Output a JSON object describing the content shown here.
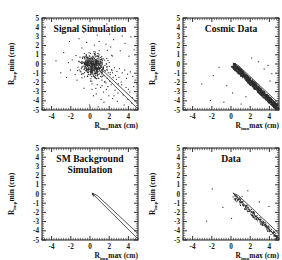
{
  "figure": {
    "panel_count": 4,
    "axis": {
      "xlabel_main": "R",
      "xlabel_sub": "imp",
      "xlabel_rest": "max (cm)",
      "ylabel_main": "R",
      "ylabel_sub": "imp",
      "ylabel_rest": "min (cm)",
      "xticks": [
        "-4",
        "-2",
        "0",
        "2",
        "4"
      ],
      "xtick_values": [
        -4,
        -2,
        0,
        2,
        4
      ],
      "yticks": [
        "5",
        "4",
        "3",
        "2",
        "1",
        "0",
        "-1",
        "-2",
        "-3",
        "-4",
        "-5"
      ],
      "ytick_values": [
        5,
        4,
        3,
        2,
        1,
        0,
        -1,
        -2,
        -3,
        -4,
        -5
      ],
      "xlim": [
        -5,
        5
      ],
      "ylim": [
        -5,
        5
      ]
    }
  },
  "colors": {
    "ink": "#1a1a1a",
    "point": "#2e2e2e",
    "line": "#2b2b2b",
    "background": "#ffffff"
  },
  "chart_data": [
    {
      "type": "scatter",
      "title": "Signal Simulation",
      "title_lines": [
        "Signal Simulation"
      ],
      "xlabel": "R_imp max (cm)",
      "ylabel": "R_imp min (cm)",
      "xlim": [
        -5,
        5
      ],
      "ylim": [
        -5,
        5
      ],
      "grid": false,
      "legend": "none",
      "annotations": [
        {
          "type": "band",
          "note": "cosmic rejection band",
          "line1": [
            [
              0.2,
              0.1
            ],
            [
              5.0,
              -4.9
            ]
          ],
          "line2": [
            [
              0.75,
              -0.15
            ],
            [
              5.0,
              -4.3
            ]
          ]
        }
      ],
      "points": [
        [
          0.05,
          0.15
        ],
        [
          0.2,
          -0.05
        ],
        [
          -0.1,
          0.3
        ],
        [
          0.35,
          0.05
        ],
        [
          0.5,
          -0.3
        ],
        [
          -0.3,
          -0.2
        ],
        [
          0.15,
          -0.55
        ],
        [
          0.6,
          0.25
        ],
        [
          0.8,
          -0.1
        ],
        [
          -0.45,
          0.1
        ],
        [
          0.25,
          0.45
        ],
        [
          0.95,
          -0.45
        ],
        [
          1.2,
          -0.2
        ],
        [
          0.45,
          -0.85
        ],
        [
          -0.15,
          -0.75
        ],
        [
          1.05,
          0.15
        ],
        [
          0.7,
          -0.65
        ],
        [
          1.35,
          -0.55
        ],
        [
          0.1,
          0.75
        ],
        [
          -0.55,
          -0.45
        ],
        [
          1.55,
          -0.15
        ],
        [
          0.85,
          0.55
        ],
        [
          0.3,
          -1.15
        ],
        [
          1.75,
          -0.35
        ],
        [
          -0.75,
          0.05
        ],
        [
          1.15,
          -0.95
        ],
        [
          0.55,
          1.05
        ],
        [
          2.0,
          -0.25
        ],
        [
          -0.25,
          -1.35
        ],
        [
          1.45,
          -1.25
        ],
        [
          0.9,
          -1.55
        ],
        [
          2.25,
          -0.6
        ],
        [
          0.05,
          -1.85
        ],
        [
          1.9,
          -0.95
        ],
        [
          -0.95,
          -0.85
        ],
        [
          2.55,
          -0.4
        ],
        [
          1.25,
          -1.75
        ],
        [
          0.4,
          1.35
        ],
        [
          2.8,
          -0.8
        ],
        [
          -1.25,
          -0.35
        ],
        [
          1.65,
          -2.05
        ],
        [
          3.05,
          -0.5
        ],
        [
          0.75,
          -2.25
        ],
        [
          2.4,
          -1.45
        ],
        [
          -0.6,
          1.15
        ],
        [
          3.35,
          -0.95
        ],
        [
          2.05,
          -1.85
        ],
        [
          1.1,
          -2.55
        ],
        [
          3.6,
          -0.65
        ],
        [
          -1.55,
          -1.15
        ],
        [
          2.75,
          -1.65
        ],
        [
          0.2,
          -2.75
        ],
        [
          3.9,
          -1.1
        ],
        [
          1.85,
          -2.45
        ],
        [
          4.2,
          -0.85
        ],
        [
          2.95,
          -2.15
        ],
        [
          -0.85,
          1.75
        ],
        [
          1.4,
          -3.05
        ],
        [
          4.45,
          -1.35
        ],
        [
          3.25,
          -1.95
        ],
        [
          0.65,
          -3.25
        ],
        [
          2.6,
          -2.85
        ],
        [
          4.7,
          -1.75
        ],
        [
          -2.05,
          -0.65
        ],
        [
          3.75,
          -2.55
        ],
        [
          1.95,
          -3.45
        ],
        [
          4.15,
          -3.05
        ],
        [
          0.45,
          2.05
        ],
        [
          2.35,
          -3.75
        ],
        [
          4.55,
          -2.45
        ],
        [
          3.45,
          -3.35
        ],
        [
          1.15,
          -3.85
        ],
        [
          -1.85,
          0.45
        ],
        [
          4.85,
          -2.05
        ],
        [
          2.85,
          -4.05
        ],
        [
          0.95,
          2.45
        ],
        [
          3.95,
          -3.85
        ],
        [
          -0.35,
          2.35
        ],
        [
          4.35,
          -4.25
        ],
        [
          1.65,
          2.15
        ],
        [
          -2.45,
          -1.45
        ],
        [
          2.15,
          1.85
        ],
        [
          4.9,
          -3.45
        ],
        [
          -1.15,
          2.75
        ],
        [
          3.15,
          1.45
        ],
        [
          0.75,
          3.15
        ],
        [
          -3.05,
          -0.95
        ],
        [
          2.45,
          2.65
        ],
        [
          4.05,
          0.85
        ],
        [
          -0.65,
          3.45
        ],
        [
          1.35,
          3.75
        ],
        [
          3.65,
          2.25
        ],
        [
          -2.75,
          1.25
        ],
        [
          0.25,
          4.05
        ],
        [
          4.6,
          1.55
        ],
        [
          2.05,
          3.25
        ],
        [
          -1.45,
          3.85
        ],
        [
          3.35,
          3.05
        ],
        [
          -3.55,
          0.35
        ],
        [
          1.75,
          4.35
        ],
        [
          4.25,
          2.95
        ],
        [
          -0.05,
          -4.45
        ],
        [
          2.65,
          4.15
        ],
        [
          -2.15,
          2.45
        ],
        [
          0.15,
          -0.25
        ],
        [
          0.4,
          0.35
        ],
        [
          -0.2,
          -0.45
        ],
        [
          0.65,
          -0.75
        ],
        [
          1.0,
          0.45
        ],
        [
          0.3,
          0.85
        ],
        [
          -0.4,
          0.55
        ],
        [
          0.85,
          -1.15
        ],
        [
          1.3,
          0.35
        ],
        [
          0.55,
          -1.45
        ],
        [
          1.6,
          -0.75
        ],
        [
          0.05,
          1.15
        ],
        [
          -0.7,
          -1.05
        ],
        [
          1.1,
          -1.35
        ],
        [
          2.1,
          -1.15
        ],
        [
          0.95,
          1.45
        ],
        [
          1.5,
          -1.95
        ],
        [
          2.35,
          -0.95
        ],
        [
          0.2,
          -2.15
        ],
        [
          1.8,
          -1.55
        ],
        [
          -1.05,
          0.75
        ],
        [
          2.65,
          -1.25
        ],
        [
          1.25,
          -2.35
        ],
        [
          3.0,
          -1.45
        ],
        [
          0.6,
          -2.65
        ],
        [
          2.2,
          -2.25
        ],
        [
          3.3,
          -2.25
        ],
        [
          1.7,
          -2.75
        ],
        [
          -1.35,
          -1.75
        ],
        [
          2.9,
          -3.15
        ],
        [
          0.35,
          -3.45
        ],
        [
          3.8,
          -1.55
        ],
        [
          1.45,
          -4.15
        ],
        [
          4.0,
          -2.75
        ],
        [
          2.5,
          -3.45
        ],
        [
          -2.25,
          0.15
        ],
        [
          4.4,
          -3.65
        ],
        [
          3.55,
          -4.45
        ],
        [
          0.85,
          -4.65
        ],
        [
          2.25,
          0.95
        ]
      ],
      "dense_cluster": {
        "center": [
          0.3,
          -0.2
        ],
        "n": 420,
        "sigma_x": 0.62,
        "sigma_y": 0.58
      }
    },
    {
      "type": "scatter",
      "title": "Cosmic Data",
      "title_lines": [
        "Cosmic Data"
      ],
      "xlabel": "R_imp max (cm)",
      "ylabel": "R_imp min (cm)",
      "xlim": [
        -5,
        5
      ],
      "ylim": [
        -5,
        5
      ],
      "grid": false,
      "legend": "none",
      "annotations": [
        {
          "type": "band",
          "note": "cosmic rejection band",
          "line1": [
            [
              0.2,
              0.1
            ],
            [
              5.0,
              -4.9
            ]
          ],
          "line2": [
            [
              0.75,
              -0.15
            ],
            [
              5.0,
              -4.3
            ]
          ]
        }
      ],
      "points": [
        [
          0.25,
          0.0
        ],
        [
          0.45,
          -0.3
        ],
        [
          0.65,
          -0.5
        ],
        [
          0.85,
          -0.75
        ],
        [
          1.05,
          -0.95
        ],
        [
          1.25,
          -1.15
        ],
        [
          1.45,
          -1.35
        ],
        [
          1.65,
          -1.55
        ],
        [
          1.85,
          -1.75
        ],
        [
          2.05,
          -1.95
        ],
        [
          2.25,
          -2.15
        ],
        [
          2.45,
          -2.35
        ],
        [
          2.65,
          -2.55
        ],
        [
          2.85,
          -2.75
        ],
        [
          3.05,
          -2.95
        ],
        [
          3.25,
          -3.15
        ],
        [
          3.45,
          -3.35
        ],
        [
          3.65,
          -3.55
        ],
        [
          3.85,
          -3.75
        ],
        [
          4.05,
          -3.95
        ],
        [
          4.25,
          -4.15
        ],
        [
          4.45,
          -4.35
        ],
        [
          4.65,
          -4.55
        ],
        [
          4.85,
          -4.75
        ],
        [
          0.35,
          -0.15
        ],
        [
          0.55,
          -0.4
        ],
        [
          0.75,
          -0.6
        ],
        [
          0.95,
          -0.85
        ],
        [
          1.15,
          -1.05
        ],
        [
          1.35,
          -1.25
        ],
        [
          1.55,
          -1.45
        ],
        [
          1.75,
          -1.65
        ],
        [
          1.95,
          -1.85
        ],
        [
          2.15,
          -2.05
        ],
        [
          2.35,
          -2.25
        ],
        [
          2.55,
          -2.45
        ],
        [
          2.75,
          -2.65
        ],
        [
          2.95,
          -2.85
        ],
        [
          3.15,
          -3.05
        ],
        [
          3.35,
          -3.25
        ],
        [
          3.55,
          -3.45
        ],
        [
          3.75,
          -3.65
        ],
        [
          3.95,
          -3.85
        ],
        [
          4.15,
          -4.05
        ],
        [
          4.35,
          -4.25
        ],
        [
          4.55,
          -4.45
        ],
        [
          4.75,
          -4.65
        ],
        [
          4.95,
          -4.85
        ],
        [
          -2.15,
          -3.95
        ],
        [
          -1.25,
          -0.35
        ],
        [
          3.45,
          -0.55
        ],
        [
          2.15,
          0.65
        ],
        [
          4.25,
          -1.05
        ],
        [
          -0.45,
          -2.35
        ],
        [
          1.05,
          -4.35
        ],
        [
          3.85,
          -0.15
        ],
        [
          -3.05,
          -2.15
        ],
        [
          0.15,
          -3.15
        ],
        [
          2.85,
          0.25
        ],
        [
          4.65,
          -2.05
        ],
        [
          -1.85,
          -1.25
        ],
        [
          1.55,
          -3.55
        ],
        [
          -0.75,
          -4.15
        ],
        [
          4.05,
          -1.85
        ]
      ],
      "dense_band": {
        "n": 900,
        "x_range": [
          0.2,
          5.0
        ],
        "width": 0.55,
        "note": "tight diagonal locus R_min = -R_max"
      }
    },
    {
      "type": "scatter",
      "title": "SM Background Simulation",
      "title_lines": [
        "SM Background",
        "Simulation"
      ],
      "xlabel": "R_imp max (cm)",
      "ylabel": "R_imp min (cm)",
      "xlim": [
        -5,
        5
      ],
      "ylim": [
        -5,
        5
      ],
      "grid": false,
      "legend": "none",
      "annotations": [
        {
          "type": "band",
          "note": "cosmic rejection band",
          "line1": [
            [
              0.2,
              0.1
            ],
            [
              5.0,
              -4.9
            ]
          ],
          "line2": [
            [
              0.75,
              -0.15
            ],
            [
              5.0,
              -4.3
            ]
          ]
        }
      ],
      "points": [
        [
          0.3,
          0.05
        ],
        [
          0.4,
          -0.1
        ],
        [
          0.25,
          -0.05
        ],
        [
          0.35,
          -0.2
        ]
      ],
      "dense_band": {
        "n": 0,
        "note": "empty — no entries"
      }
    },
    {
      "type": "scatter",
      "title": "Data",
      "title_lines": [
        "Data"
      ],
      "xlabel": "R_imp max (cm)",
      "ylabel": "R_imp min (cm)",
      "xlim": [
        -5,
        5
      ],
      "ylim": [
        -5,
        5
      ],
      "grid": false,
      "legend": "none",
      "annotations": [
        {
          "type": "band",
          "note": "cosmic rejection band",
          "line1": [
            [
              0.2,
              0.1
            ],
            [
              5.0,
              -4.9
            ]
          ],
          "line2": [
            [
              0.75,
              -0.15
            ],
            [
              5.0,
              -4.3
            ]
          ]
        }
      ],
      "points": [
        [
          0.35,
          -0.1
        ],
        [
          0.6,
          -0.45
        ],
        [
          0.9,
          -0.8
        ],
        [
          1.2,
          -1.1
        ],
        [
          1.5,
          -1.4
        ],
        [
          1.8,
          -1.7
        ],
        [
          2.1,
          -2.0
        ],
        [
          2.4,
          -2.3
        ],
        [
          2.7,
          -2.6
        ],
        [
          3.0,
          -2.9
        ],
        [
          3.3,
          -3.2
        ],
        [
          3.6,
          -3.5
        ],
        [
          3.9,
          -3.8
        ],
        [
          4.2,
          -4.1
        ],
        [
          4.5,
          -4.4
        ],
        [
          4.75,
          -4.65
        ],
        [
          0.75,
          -0.6
        ],
        [
          1.05,
          -0.95
        ],
        [
          1.35,
          -1.25
        ],
        [
          1.65,
          -1.55
        ],
        [
          1.95,
          -1.85
        ],
        [
          2.25,
          -2.15
        ],
        [
          2.55,
          -2.45
        ],
        [
          2.85,
          -2.75
        ],
        [
          3.15,
          -3.05
        ],
        [
          3.45,
          -3.35
        ],
        [
          3.75,
          -3.65
        ],
        [
          4.05,
          -3.95
        ],
        [
          4.35,
          -4.25
        ],
        [
          4.6,
          -4.5
        ],
        [
          -0.85,
          -1.45
        ],
        [
          1.15,
          -0.25
        ],
        [
          -1.95,
          0.55
        ],
        [
          2.95,
          -0.85
        ],
        [
          0.05,
          -2.65
        ],
        [
          3.95,
          -1.35
        ],
        [
          -2.55,
          -2.95
        ],
        [
          1.75,
          0.35
        ]
      ],
      "dense_band": {
        "n": 160,
        "x_range": [
          0.3,
          4.9
        ],
        "width": 0.5,
        "note": "sparse diagonal locus"
      }
    }
  ]
}
